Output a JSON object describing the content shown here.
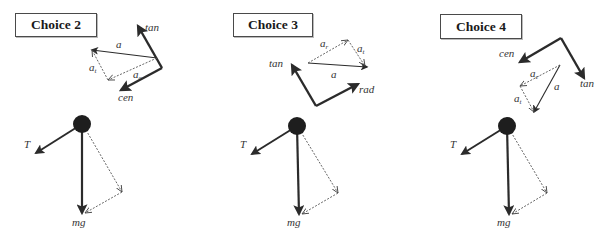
{
  "choices": [
    {
      "label": "Choice 2",
      "box": {
        "x": 15,
        "y": 13,
        "w": 82,
        "h": 24
      },
      "frame": {
        "corner": [
          162,
          68
        ],
        "tan_tip": [
          138,
          26
        ],
        "cen_tip": [
          121,
          90
        ],
        "tan_label": "tan",
        "cen_label": "cen",
        "tan_label_pos": [
          145,
          31
        ],
        "cen_label_pos": [
          118,
          101
        ]
      },
      "accel": {
        "vector": {
          "from": [
            157,
            58
          ],
          "to": [
            92,
            50
          ],
          "label": "a⃗",
          "label_pos": [
            116,
            48
          ]
        },
        "comp1": {
          "from": [
            157,
            58
          ],
          "to": [
            108,
            80
          ],
          "label": "a",
          "sub": "c",
          "label_pos": [
            133,
            78
          ]
        },
        "comp2": {
          "from": [
            108,
            80
          ],
          "to": [
            92,
            50
          ],
          "label": "a",
          "sub": "t",
          "label_pos": [
            89,
            71
          ]
        }
      },
      "pendulum": {
        "ball": [
          82,
          124
        ],
        "T_tip": [
          36,
          153
        ],
        "mg_tip": [
          82,
          213
        ],
        "dash_mid": [
          122,
          192
        ],
        "T_label": "T",
        "mg_label": "mg",
        "T_label_pos": [
          24,
          148
        ],
        "mg_label_pos": [
          72,
          226
        ]
      }
    },
    {
      "label": "Choice 3",
      "box": {
        "x": 233,
        "y": 13,
        "w": 80,
        "h": 24
      },
      "frame": {
        "corner": [
          316,
          106
        ],
        "tan_tip": [
          292,
          65
        ],
        "cen_tip": [
          358,
          84
        ],
        "tan_label": "tan",
        "cen_label": "rad",
        "tan_label_pos": [
          269,
          67
        ],
        "cen_label_pos": [
          359,
          93
        ]
      },
      "accel": {
        "vector": {
          "from": [
            308,
            63
          ],
          "to": [
            367,
            67
          ],
          "label": "a⃗",
          "label_pos": [
            331,
            78
          ]
        },
        "comp1": {
          "from": [
            308,
            63
          ],
          "to": [
            348,
            40
          ],
          "label": "a",
          "sub": "r",
          "label_pos": [
            320,
            47
          ]
        },
        "comp2": {
          "from": [
            348,
            40
          ],
          "to": [
            365,
            66
          ],
          "label": "a",
          "sub": "t",
          "label_pos": [
            357,
            52
          ]
        }
      },
      "pendulum": {
        "ball": [
          297,
          126
        ],
        "T_tip": [
          252,
          154
        ],
        "mg_tip": [
          299,
          214
        ],
        "dash_mid": [
          338,
          193
        ],
        "T_label": "T",
        "mg_label": "mg",
        "T_label_pos": [
          240,
          148
        ],
        "mg_label_pos": [
          287,
          226
        ]
      }
    },
    {
      "label": "Choice 4",
      "box": {
        "x": 440,
        "y": 14,
        "w": 82,
        "h": 25
      },
      "frame": {
        "corner": [
          561,
          38
        ],
        "tan_tip": [
          584,
          78
        ],
        "cen_tip": [
          520,
          62
        ],
        "tan_label": "tan",
        "cen_label": "cen",
        "tan_label_pos": [
          580,
          87
        ],
        "cen_label_pos": [
          499,
          57
        ]
      },
      "accel": {
        "vector": {
          "from": [
            560,
            65
          ],
          "to": [
            534,
            112
          ],
          "label": "a⃗",
          "label_pos": [
            554,
            90
          ]
        },
        "comp1": {
          "from": [
            560,
            65
          ],
          "to": [
            520,
            86
          ],
          "label": "a",
          "sub": "c",
          "label_pos": [
            530,
            77
          ]
        },
        "comp2": {
          "from": [
            520,
            86
          ],
          "to": [
            534,
            112
          ],
          "label": "a",
          "sub": "t",
          "label_pos": [
            514,
            102
          ]
        }
      },
      "pendulum": {
        "ball": [
          507,
          126
        ],
        "T_tip": [
          462,
          154
        ],
        "mg_tip": [
          509,
          214
        ],
        "dash_mid": [
          547,
          193
        ],
        "T_label": "T",
        "mg_label": "mg",
        "T_label_pos": [
          450,
          148
        ],
        "mg_label_pos": [
          497,
          226
        ]
      }
    }
  ],
  "colors": {
    "ink": "#2b2b2b",
    "ball": "#1e1e1e",
    "dashed": "#555555"
  }
}
